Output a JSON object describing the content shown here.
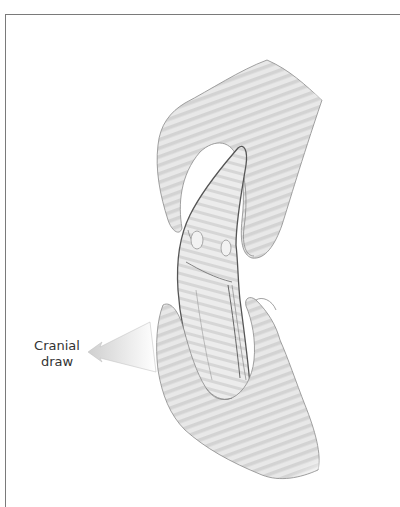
{
  "figure": {
    "annotation": {
      "line1": "Cranial",
      "line2": "draw",
      "arrow_direction": "left"
    },
    "colors": {
      "border": "#7a7a7a",
      "skin_fill": "#e4e4e4",
      "stripe": "#d2d2d2",
      "outline": "#6b6b6b",
      "text": "#333333"
    }
  }
}
